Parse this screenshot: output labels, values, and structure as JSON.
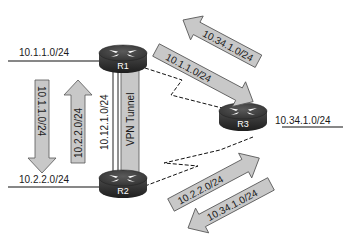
{
  "diagram": {
    "routers": [
      {
        "id": "R1",
        "label": "R1"
      },
      {
        "id": "R2",
        "label": "R2"
      },
      {
        "id": "R3",
        "label": "R3"
      }
    ],
    "networks": {
      "r1_lan": "10.1.1.0/24",
      "r2_lan": "10.2.2.0/24",
      "r3_lan": "10.34.1.0/24",
      "r1_r2_link": "10.12.1.0/24"
    },
    "tunnel": {
      "label": "VPN Tunnel"
    },
    "route_arrows": {
      "left_down": "10.1.1.0/24",
      "left_up": "10.2.2.0/24",
      "top_to_r1": "10.34.1.0/24",
      "top_to_r3": "10.1.1.0/24",
      "bottom_to_r3": "10.2.2.0/24",
      "bottom_to_r2": "10.34.1.0/24"
    },
    "colors": {
      "arrow_fill": "#c8c8c8",
      "arrow_stroke": "#555555",
      "router_top": "#3a3a3a",
      "router_side": "#262626",
      "line": "#111111"
    }
  }
}
